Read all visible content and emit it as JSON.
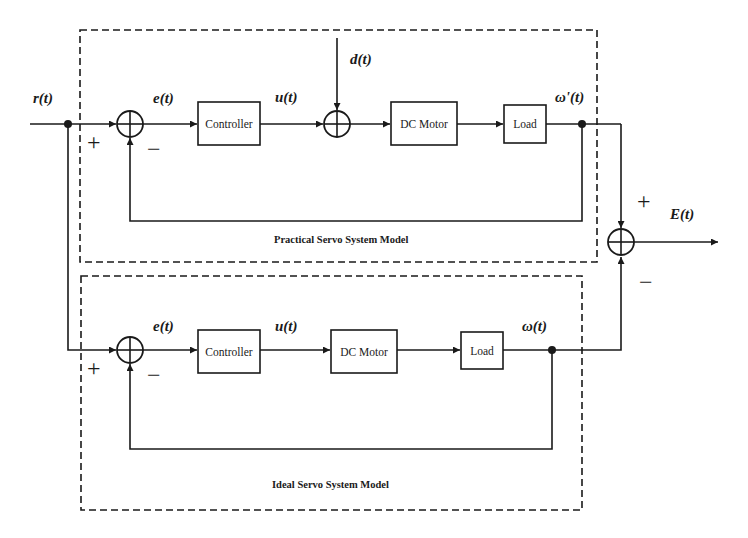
{
  "diagram": {
    "signals": {
      "reference": "r(t)",
      "error_practical": "e(t)",
      "control_practical": "u(t)",
      "disturbance": "d(t)",
      "output_practical": "ω'(t)",
      "error_ideal": "e(t)",
      "control_ideal": "u(t)",
      "output_ideal": "ω(t)",
      "difference": "E(t)"
    },
    "practical_model": {
      "caption": "Practical Servo System Model",
      "blocks": [
        "Controller",
        "DC Motor",
        "Load"
      ]
    },
    "ideal_model": {
      "caption": "Ideal Servo System Model",
      "blocks": [
        "Controller",
        "DC Motor",
        "Load"
      ]
    },
    "signs": {
      "plus": "+",
      "minus": "−"
    }
  }
}
